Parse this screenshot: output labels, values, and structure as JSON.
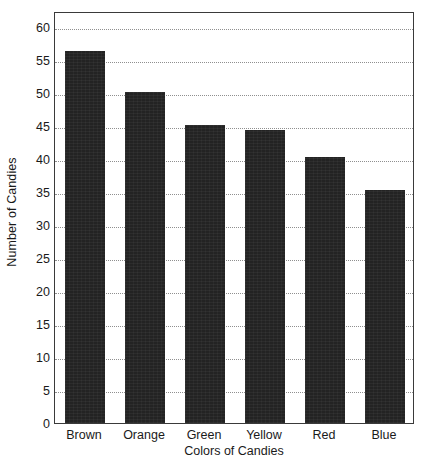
{
  "chart_data": {
    "type": "bar",
    "title": "",
    "xlabel": "Colors of Candies",
    "ylabel": "Number of Candies",
    "categories": [
      "Brown",
      "Orange",
      "Green",
      "Yellow",
      "Red",
      "Blue"
    ],
    "values": [
      56.5,
      50.2,
      45.2,
      44.4,
      40.4,
      35.3
    ],
    "ylim": [
      0,
      62.5
    ],
    "yticks": [
      0,
      5,
      10,
      15,
      20,
      25,
      30,
      35,
      40,
      45,
      50,
      55,
      60
    ],
    "ytick_labels": [
      "0",
      "5",
      "10",
      "15",
      "20",
      "25",
      "30",
      "35",
      "40",
      "45",
      "50",
      "55",
      "60"
    ],
    "grid": true,
    "grid_axis": "y",
    "grid_style": "dotted",
    "legend": false,
    "bar_color": "#232323",
    "grid_color": "#8f8f8f",
    "frame_color": "#3a3a3a",
    "background_color": "#ffffff"
  }
}
